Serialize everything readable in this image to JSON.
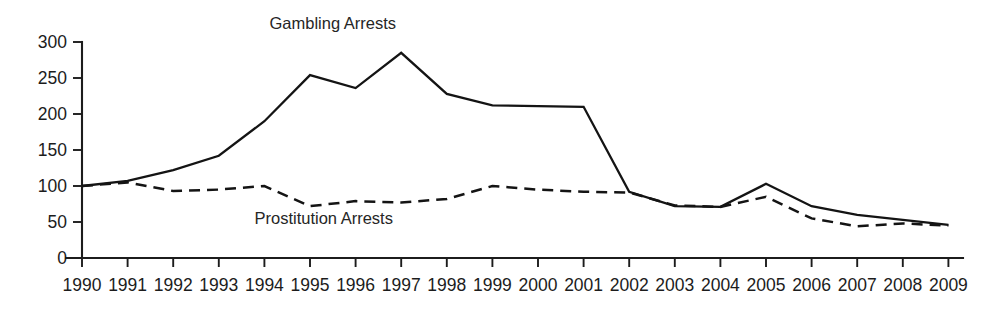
{
  "chart_data": {
    "type": "line",
    "title": "",
    "xlabel": "",
    "ylabel": "",
    "ylim": [
      0,
      300
    ],
    "yticks": [
      0,
      50,
      100,
      150,
      200,
      250,
      300
    ],
    "grid": false,
    "legend_position": "inline-annotations",
    "x": [
      1990,
      1991,
      1992,
      1993,
      1994,
      1995,
      1996,
      1997,
      1998,
      1999,
      2000,
      2001,
      2002,
      2003,
      2004,
      2005,
      2006,
      2007,
      2008,
      2009
    ],
    "xticklabels": [
      "1990",
      "1991",
      "1992",
      "1993",
      "1994",
      "1995",
      "1996",
      "1997",
      "1998",
      "1999",
      "2000",
      "2001",
      "2002",
      "2003",
      "2004",
      "2005",
      "2006",
      "2007",
      "2008",
      "2009"
    ],
    "series": [
      {
        "name": "Gambling Arrests",
        "style": "solid",
        "color": "#141414",
        "values": [
          100,
          107,
          122,
          142,
          190,
          254,
          236,
          285,
          228,
          212,
          211,
          210,
          92,
          72,
          71,
          103,
          72,
          60,
          53,
          46
        ]
      },
      {
        "name": "Prostitution Arrests",
        "style": "dashed",
        "color": "#141414",
        "values": [
          100,
          105,
          93,
          95,
          100,
          72,
          79,
          77,
          82,
          100,
          95,
          92,
          91,
          73,
          71,
          85,
          55,
          44,
          48,
          45
        ]
      }
    ],
    "annotations": [
      {
        "text": "Gambling Arrests",
        "x": 1995.5,
        "y": 318
      },
      {
        "text": "Prostitution Arrests",
        "x": 1995.3,
        "y": 47
      }
    ]
  },
  "axis": {
    "y_tick_labels": [
      "300",
      "250",
      "200",
      "150",
      "100",
      "50",
      "0"
    ],
    "x_tick_labels": [
      "1990",
      "1991",
      "1992",
      "1993",
      "1994",
      "1995",
      "1996",
      "1997",
      "1998",
      "1999",
      "2000",
      "2001",
      "2002",
      "2003",
      "2004",
      "2005",
      "2006",
      "2007",
      "2008",
      "2009"
    ]
  },
  "labels": {
    "gambling": "Gambling Arrests",
    "prostitution": "Prostitution Arrests"
  }
}
